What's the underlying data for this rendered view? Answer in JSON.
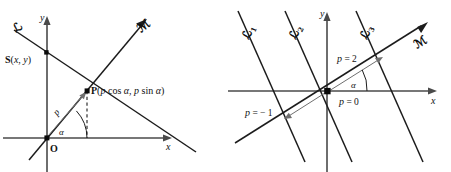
{
  "figure": {
    "background_color": "#ffffff",
    "line_color": "#1c1c1c",
    "axis_color": "#4a4a4a",
    "measure_color": "#6f6f6f",
    "width": 451,
    "height": 172
  },
  "left_panel": {
    "name": "normal-form-of-a-line",
    "axes": {
      "x_label": "x",
      "y_label": "y",
      "origin_label": "O"
    },
    "lines": [
      {
        "id": "L",
        "label": "ℒ",
        "role": "given-line"
      },
      {
        "id": "M",
        "label": "ℳ",
        "role": "normal-ray"
      }
    ],
    "points": [
      {
        "id": "S",
        "name_label": "S",
        "coords_label": "(x, y)",
        "full_label": "S(x, y)"
      },
      {
        "id": "P",
        "name_label": "P",
        "coords_label": "(p cos α, p sin α)",
        "full_label": "P(p cos α, p sin α)",
        "coord_parts": {
          "open": "(",
          "p1": "p",
          "cos": " cos ",
          "alpha1": "α",
          "comma": ", ",
          "p2": "p",
          "sin": " sin ",
          "alpha2": "α",
          "close": ")"
        }
      }
    ],
    "annotations": [
      {
        "id": "distance-p",
        "label": "p",
        "meaning": "distance from origin to line"
      },
      {
        "id": "angle-alpha",
        "label": "α",
        "meaning": "angle of normal from x-axis"
      }
    ]
  },
  "right_panel": {
    "name": "family-of-parallel-lines",
    "axes": {
      "x_label": "x",
      "y_label": "y"
    },
    "lines": [
      {
        "id": "L1",
        "label": "ℒ",
        "subscript": "1",
        "p_value": "p = -1"
      },
      {
        "id": "L2",
        "label": "ℒ",
        "subscript": "2",
        "p_value": "p = 0"
      },
      {
        "id": "L3",
        "label": "ℒ",
        "subscript": "3",
        "p_value": "p = 2"
      },
      {
        "id": "M",
        "label": "ℳ",
        "subscript": "",
        "role": "normal-ray"
      }
    ],
    "annotations": [
      {
        "id": "p-eq-2",
        "label": "p = 2",
        "parts": {
          "p": "p",
          "rest": " = 2"
        }
      },
      {
        "id": "p-eq-0",
        "label": "p = 0",
        "parts": {
          "p": "p",
          "rest": " = 0"
        }
      },
      {
        "id": "p-eq-neg1",
        "label": "p = − 1",
        "parts": {
          "p": "p",
          "rest": " = − 1"
        }
      },
      {
        "id": "angle-alpha",
        "label": "α",
        "meaning": "angle of normal from x-axis"
      }
    ]
  }
}
